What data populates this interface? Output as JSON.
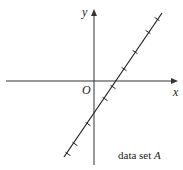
{
  "chart_data": {
    "type": "scatter",
    "title": "",
    "xlabel": "x",
    "ylabel": "y",
    "origin_label": "O",
    "annotation": "data set A",
    "annotation_prefix": "data set ",
    "annotation_var": "A",
    "grid": false,
    "legend": "none",
    "axis_ticks": "none",
    "fit_line": {
      "description": "straight line with positive slope, crossing negative y-axis and positive x-axis",
      "pixel_from": [
        64,
        157
      ],
      "pixel_to": [
        162,
        13
      ]
    },
    "points_pixel": [
      [
        157,
        19
      ],
      [
        148,
        32
      ],
      [
        135,
        52
      ],
      [
        124,
        69
      ],
      [
        113,
        87
      ],
      [
        105,
        99
      ],
      [
        88,
        124
      ],
      [
        75,
        144
      ],
      [
        68,
        154
      ]
    ],
    "marker": "x-cross",
    "color": "#222222"
  }
}
